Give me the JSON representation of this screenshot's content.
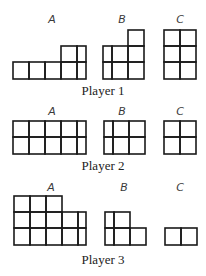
{
  "figure": {
    "width": 206,
    "height": 276,
    "stroke_color": "#1a1a1a",
    "players": [
      {
        "label": "Player 1",
        "label_y": 84,
        "sets": [
          {
            "label": "A",
            "label_x": 52,
            "label_y": 14,
            "col_edges": [
              13,
              29,
              45,
              61,
              77,
              86
            ],
            "row_edges": [
              46,
              62,
              79
            ],
            "cells": [
              [
                0,
                3
              ],
              [
                0,
                4
              ],
              [
                1,
                0
              ],
              [
                1,
                1
              ],
              [
                1,
                2
              ],
              [
                1,
                3
              ],
              [
                1,
                4
              ]
            ]
          },
          {
            "label": "B",
            "label_x": 122,
            "label_y": 14,
            "col_edges": [
              103,
              112,
              128,
              144
            ],
            "row_edges": [
              30,
              46,
              62,
              79
            ],
            "cells": [
              [
                0,
                2
              ],
              [
                1,
                0
              ],
              [
                1,
                1
              ],
              [
                1,
                2
              ],
              [
                2,
                0
              ],
              [
                2,
                1
              ],
              [
                2,
                2
              ]
            ]
          },
          {
            "label": "C",
            "label_x": 180,
            "label_y": 14,
            "col_edges": [
              164,
              180,
              196
            ],
            "row_edges": [
              30,
              46,
              62,
              79
            ],
            "cells": [
              [
                0,
                0
              ],
              [
                0,
                1
              ],
              [
                1,
                0
              ],
              [
                1,
                1
              ],
              [
                2,
                0
              ],
              [
                2,
                1
              ]
            ]
          }
        ]
      },
      {
        "label": "Player 2",
        "label_y": 159,
        "sets": [
          {
            "label": "A",
            "label_x": 52,
            "label_y": 106,
            "col_edges": [
              13,
              29,
              45,
              61,
              77,
              86
            ],
            "row_edges": [
              121,
              137,
              154
            ],
            "cells": [
              [
                0,
                0
              ],
              [
                0,
                1
              ],
              [
                0,
                2
              ],
              [
                0,
                3
              ],
              [
                0,
                4
              ],
              [
                1,
                0
              ],
              [
                1,
                1
              ],
              [
                1,
                2
              ],
              [
                1,
                3
              ],
              [
                1,
                4
              ]
            ]
          },
          {
            "label": "B",
            "label_x": 122,
            "label_y": 106,
            "col_edges": [
              104,
              113,
              129,
              145
            ],
            "row_edges": [
              121,
              137,
              154
            ],
            "cells": [
              [
                0,
                0
              ],
              [
                0,
                1
              ],
              [
                0,
                2
              ],
              [
                1,
                0
              ],
              [
                1,
                1
              ],
              [
                1,
                2
              ]
            ]
          },
          {
            "label": "C",
            "label_x": 180,
            "label_y": 106,
            "col_edges": [
              164,
              180,
              196
            ],
            "row_edges": [
              121,
              137,
              154
            ],
            "cells": [
              [
                0,
                0
              ],
              [
                0,
                1
              ],
              [
                1,
                0
              ],
              [
                1,
                1
              ]
            ]
          }
        ]
      },
      {
        "label": "Player 3",
        "label_y": 253,
        "sets": [
          {
            "label": "A",
            "label_x": 51,
            "label_y": 182,
            "col_edges": [
              14,
              30,
              46,
              62,
              78,
              86
            ],
            "row_edges": [
              196,
              212,
              228,
              245
            ],
            "cells": [
              [
                0,
                0
              ],
              [
                0,
                1
              ],
              [
                0,
                2
              ],
              [
                1,
                0
              ],
              [
                1,
                1
              ],
              [
                1,
                2
              ],
              [
                1,
                3
              ],
              [
                1,
                4
              ],
              [
                2,
                0
              ],
              [
                2,
                1
              ],
              [
                2,
                2
              ],
              [
                2,
                3
              ],
              [
                2,
                4
              ]
            ]
          },
          {
            "label": "B",
            "label_x": 124,
            "label_y": 182,
            "col_edges": [
              105,
              114,
              130,
              146
            ],
            "row_edges": [
              212,
              228,
              245
            ],
            "cells": [
              [
                0,
                0
              ],
              [
                0,
                1
              ],
              [
                1,
                0
              ],
              [
                1,
                1
              ],
              [
                1,
                2
              ]
            ]
          },
          {
            "label": "C",
            "label_x": 180,
            "label_y": 182,
            "col_edges": [
              165,
              181,
              197
            ],
            "row_edges": [
              228,
              245
            ],
            "cells": [
              [
                0,
                0
              ],
              [
                0,
                1
              ]
            ]
          }
        ]
      }
    ]
  }
}
